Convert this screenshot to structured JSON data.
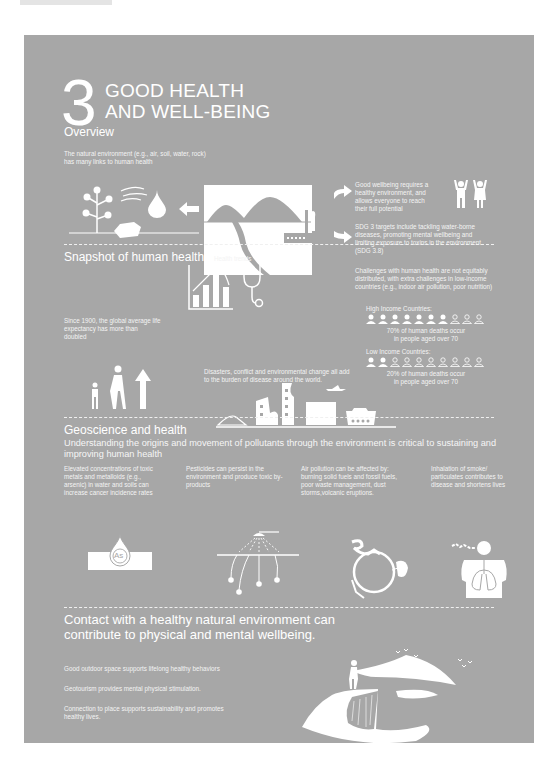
{
  "header": {
    "number": "3",
    "title_line1": "GOOD HEALTH",
    "title_line2": "AND WELL-BEING"
  },
  "overview": {
    "heading": "Overview",
    "intro": "The natural environment (e.g., air, soil, water, rock) has many links to human health",
    "wellbeing_text": "Good wellbeing requires a healthy environment, and allows everyone to reach their full potential",
    "targets_text": "SDG 3 targets include tackling water-borne diseases, promoting mental wellbeing and limiting exposure to toxins in the environment (SDG 3.8)",
    "icons": [
      "plant-icon",
      "wind-icon",
      "water-drop-icon",
      "rock-icon",
      "landscape-icon",
      "factory-icon",
      "people-celebrating-icon"
    ]
  },
  "snapshot": {
    "heading": "Snapshot of human health",
    "trends_label": "Health trends",
    "life_expectancy": "Since 1900, the global average life expectancy has more than doubled",
    "disasters": "Disasters, conflict and environmental change all add to the burden of disease around the world.",
    "inequity": "Challenges with human health are not equitably distributed, with extra challenges in low-income countries (e.g., indoor air pollution, poor nutrition)",
    "high_income": {
      "label": "High Income Countries:",
      "filled": 7,
      "total": 10,
      "caption_line1": "70% of human deaths occur",
      "caption_line2": "in people aged over 70"
    },
    "low_income": {
      "label": "Low Income Countries:",
      "filled": 2,
      "total": 10,
      "caption_line1": "20% of human deaths occur",
      "caption_line2": "in people aged over 70"
    }
  },
  "geoscience": {
    "heading": "Geoscience and health",
    "subheading": "Understanding the origins and movement of pollutants through the environment is critical to sustaining and improving human health",
    "items": [
      {
        "text": "Elevated concentrations of toxic metals and metalloids (e.g., arsenic) in water and soils can increase cancer incidence rates",
        "icon_label": "As"
      },
      {
        "text": "Pesticides can persist in the environment and produce toxic by-products"
      },
      {
        "text": "Air pollution can be affected by: burning solid fuels and fossil fuels, poor waste management, dust storms,volcanic eruptions."
      },
      {
        "text": "Inhalation of smoke/ particulates contributes to disease and shortens lives"
      }
    ]
  },
  "contact": {
    "heading": "Contact with a healthy natural environment can contribute to physical and mental wellbeing.",
    "points": [
      "Good outdoor space supports lifelong healthy behaviors",
      "Geotourism provides mental physical stimulation.",
      "Connection to place supports sustainability and promotes healthy lives."
    ]
  },
  "colors": {
    "panel": "#a7a7a7",
    "foreground": "#ffffff"
  }
}
